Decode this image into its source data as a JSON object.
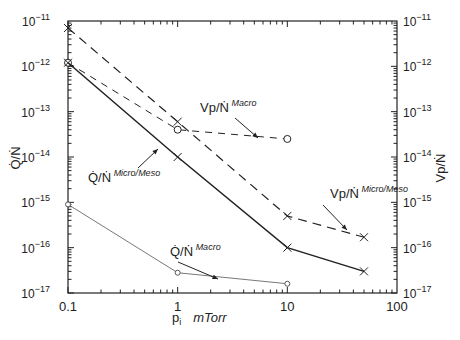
{
  "chart_data": {
    "type": "line",
    "title": "",
    "xlabel": "p_i  mTorr",
    "ylabel_left": "Q̇/Ṅ",
    "ylabel_right": "V_p/Ṅ",
    "xscale": "log",
    "yscale": "log",
    "xlim": [
      0.1,
      100
    ],
    "ylim": [
      1e-17,
      1e-11
    ],
    "x_ticks": [
      "0.1",
      "1",
      "10",
      "100"
    ],
    "y_ticks": [
      "10^-17",
      "10^-16",
      "10^-15",
      "10^-14",
      "10^-13",
      "10^-12",
      "10^-11"
    ],
    "grid": false,
    "series": [
      {
        "name": "V_p/Ṅ Micro/Meso",
        "style": "long-dash",
        "marker": "x",
        "x": [
          0.1,
          1,
          10,
          50
        ],
        "y": [
          7e-12,
          6e-14,
          5e-16,
          1.7e-16
        ]
      },
      {
        "name": "V_p/Ṅ Macro",
        "style": "short-dash",
        "marker": "circle",
        "x": [
          0.1,
          1,
          10
        ],
        "y": [
          1.2e-12,
          4e-14,
          2.5e-14
        ]
      },
      {
        "name": "Q̇/Ṅ Micro/Meso",
        "style": "solid",
        "marker": "x",
        "x": [
          0.1,
          1,
          10,
          50
        ],
        "y": [
          1.2e-12,
          1e-14,
          1e-16,
          3e-17
        ]
      },
      {
        "name": "Q̇/Ṅ Macro",
        "style": "thin-solid",
        "marker": "diamond",
        "x": [
          0.1,
          1,
          10
        ],
        "y": [
          9e-16,
          2.8e-17,
          1.6e-17
        ]
      }
    ],
    "annotations": [
      {
        "text": "V_p/Ṅ Macro",
        "base": "Vp/Ṅ",
        "sup": "Macro"
      },
      {
        "text": "V_p/Ṅ Micro/Meso",
        "base": "Vp/Ṅ",
        "sup": "Micro/Meso"
      },
      {
        "text": "Q̇/Ṅ Micro/Meso",
        "base": "Q̇/Ṅ",
        "sup": "Micro/Meso"
      },
      {
        "text": "Q̇/Ṅ Macro",
        "base": "Q̇/Ṅ",
        "sup": "Macro"
      }
    ]
  },
  "labels": {
    "x_axis": "mTorr",
    "x_var": "p",
    "x_sub": "i",
    "left_axis": "Q̇/Ṅ",
    "right_axis": "Vp/Ṅ",
    "sup_macro": "Macro",
    "sup_micro": "Micro/Meso"
  }
}
